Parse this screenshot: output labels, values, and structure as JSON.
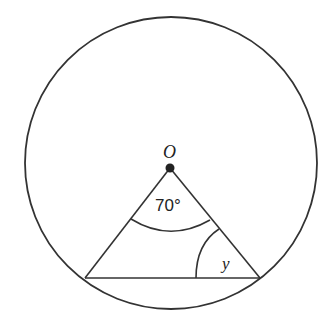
{
  "diagram": {
    "type": "circle-geometry",
    "circle": {
      "cx": 171,
      "cy": 163,
      "r": 146
    },
    "center_point": {
      "x": 170,
      "y": 168,
      "label": "O"
    },
    "chord": {
      "x1": 85,
      "y1": 278,
      "x2": 260,
      "y2": 278
    },
    "central_angle": {
      "label": "70°",
      "value_deg": 70
    },
    "base_angle": {
      "label": "y",
      "vertex": "right endpoint of chord"
    },
    "stroke_color": "#333333"
  }
}
